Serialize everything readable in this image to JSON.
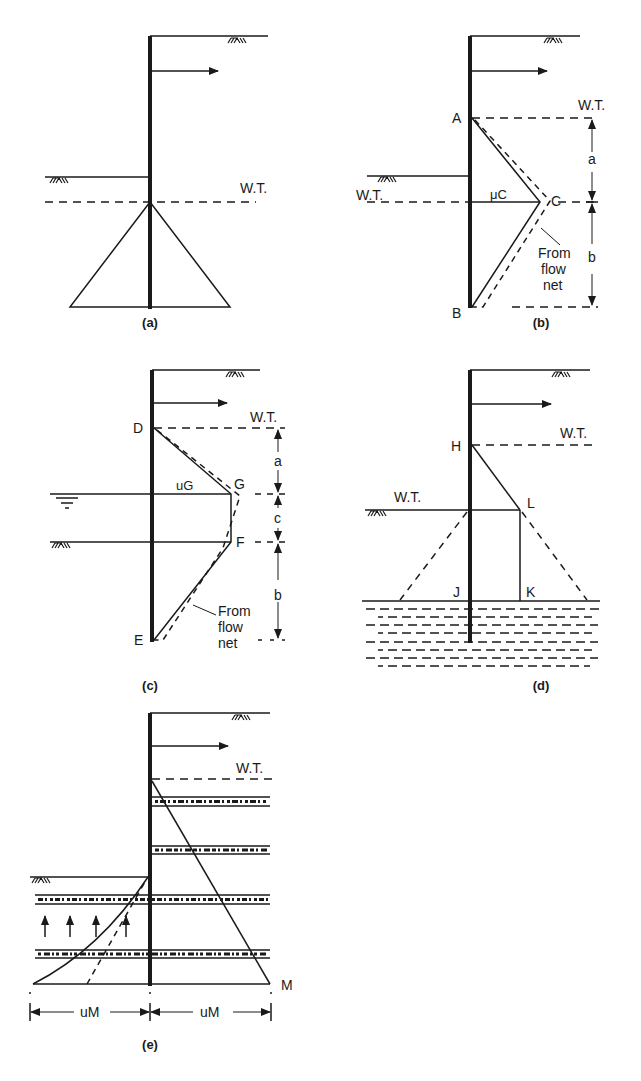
{
  "figure": {
    "stroke_color": "#1a1a1a",
    "background": "#ffffff"
  },
  "panels": {
    "a": {
      "caption": "(a)",
      "wt_label": "W.T."
    },
    "b": {
      "caption": "(b)",
      "wt_right_label": "W.T.",
      "wt_left_label": "W.T.",
      "point_A": "A",
      "point_B": "B",
      "point_C": "C",
      "pressure_label": "μC",
      "dim_a": "a",
      "dim_b": "b",
      "note_line1": "From",
      "note_line2": "flow",
      "note_line3": "net"
    },
    "c": {
      "caption": "(c)",
      "wt_label": "W.T.",
      "point_D": "D",
      "point_E": "E",
      "point_F": "F",
      "point_G": "G",
      "pressure_label": "uG",
      "dim_a": "a",
      "dim_b": "b",
      "dim_c": "c",
      "note_line1": "From",
      "note_line2": "flow",
      "note_line3": "net"
    },
    "d": {
      "caption": "(d)",
      "wt_right_label": "W.T.",
      "wt_left_label": "W.T.",
      "point_H": "H",
      "point_J": "J",
      "point_K": "K",
      "point_L": "L"
    },
    "e": {
      "caption": "(e)",
      "wt_label": "W.T.",
      "point_M": "M",
      "dim_left": "uM",
      "dim_right": "uM"
    }
  }
}
